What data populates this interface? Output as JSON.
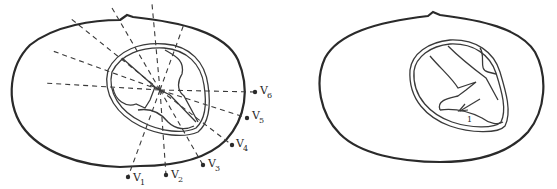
{
  "figure": {
    "left_panel": {
      "description": "Transverse thorax cross-section with heart and precordial lead positions",
      "leads": [
        {
          "label": "V",
          "sub": "1"
        },
        {
          "label": "V",
          "sub": "2"
        },
        {
          "label": "V",
          "sub": "3"
        },
        {
          "label": "V",
          "sub": "4"
        },
        {
          "label": "V",
          "sub": "5"
        },
        {
          "label": "V",
          "sub": "6"
        }
      ]
    },
    "right_panel": {
      "description": "Transverse thorax cross-section with heart and depolarization vector",
      "vector_label": "1"
    },
    "colors": {
      "line": "#2a2a2a",
      "background": "#ffffff"
    }
  }
}
